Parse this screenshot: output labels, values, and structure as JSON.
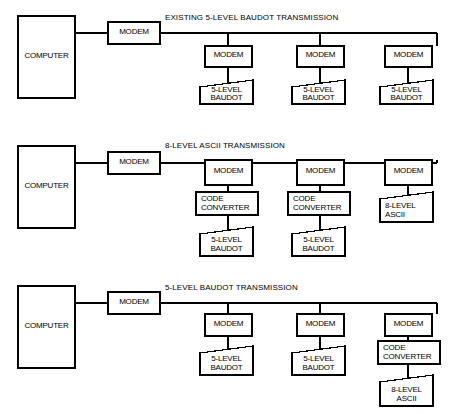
{
  "figure": {
    "line_color": "#000000",
    "background": "#ffffff",
    "accent_bold": "#000000"
  },
  "labels": {
    "computer": "COMPUTER",
    "modem": "MODEM",
    "code_converter_line1": "CODE",
    "code_converter_line2": "CONVERTER",
    "baudot_line1": "5-LEVEL",
    "baudot_line2": "BAUDOT",
    "ascii_line1": "8-LEVEL",
    "ascii_line2": "ASCII"
  },
  "panels": [
    {
      "id": "panel-existing",
      "title": "EXISTING 5-LEVEL BAUDOT TRANSMISSION",
      "host": "COMPUTER",
      "host_modem": "MODEM",
      "branches": [
        {
          "modem": "MODEM",
          "converter": null,
          "terminal": [
            "5-LEVEL",
            "BAUDOT"
          ]
        },
        {
          "modem": "MODEM",
          "converter": null,
          "terminal": [
            "5-LEVEL",
            "BAUDOT"
          ]
        },
        {
          "modem": "MODEM",
          "converter": null,
          "terminal": [
            "5-LEVEL",
            "BAUDOT"
          ]
        }
      ]
    },
    {
      "id": "panel-ascii",
      "title": "8-LEVEL ASCII TRANSMISSION",
      "host": "COMPUTER",
      "host_modem": "MODEM",
      "branches": [
        {
          "modem": "MODEM",
          "converter": [
            "CODE",
            "CONVERTER"
          ],
          "terminal": [
            "5-LEVEL",
            "BAUDOT"
          ]
        },
        {
          "modem": "MODEM",
          "converter": [
            "CODE",
            "CONVERTER"
          ],
          "terminal": [
            "5-LEVEL",
            "BAUDOT"
          ]
        },
        {
          "modem": "MODEM",
          "converter": null,
          "terminal": [
            "8-LEVEL",
            "ASCII"
          ]
        }
      ]
    },
    {
      "id": "panel-baudot",
      "title": "5-LEVEL BAUDOT TRANSMISSION",
      "host": "COMPUTER",
      "host_modem": "MODEM",
      "branches": [
        {
          "modem": "MODEM",
          "converter": null,
          "terminal": [
            "5-LEVEL",
            "BAUDOT"
          ]
        },
        {
          "modem": "MODEM",
          "converter": null,
          "terminal": [
            "5-LEVEL",
            "BAUDOT"
          ]
        },
        {
          "modem": "MODEM",
          "converter": [
            "CODE",
            "CONVERTER"
          ],
          "terminal": [
            "8-LEVEL",
            "ASCII"
          ]
        }
      ]
    }
  ]
}
